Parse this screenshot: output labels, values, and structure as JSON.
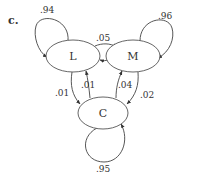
{
  "figure_label": "c.",
  "colors": {
    "stroke": "#444444",
    "text": "#333333",
    "background": "#ffffff"
  },
  "nodes": [
    {
      "id": "L",
      "label": "L"
    },
    {
      "id": "M",
      "label": "M"
    },
    {
      "id": "C",
      "label": "C"
    }
  ],
  "edges": {
    "L_L": ".94",
    "M_M": ".96",
    "C_C": ".95",
    "L_M": ".05",
    "M_L": ".02",
    "L_C": ".01",
    "C_L": ".01",
    "C_M": ".04",
    "M_C": ".02"
  }
}
